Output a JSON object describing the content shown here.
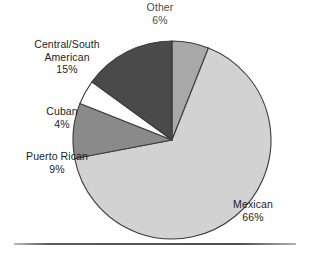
{
  "chart_data": {
    "type": "pie",
    "title": "",
    "subtitle": "",
    "xlabel": "",
    "ylabel": "",
    "legend_position": "none",
    "grid": false,
    "units": "percent",
    "start_angle_deg": 0,
    "direction": "clockwise",
    "categories": [
      "Other",
      "Mexican",
      "Puerto Rican",
      "Cuban",
      "Central/South American"
    ],
    "values": [
      6,
      66,
      9,
      4,
      15
    ],
    "slices": [
      {
        "label": "Other",
        "value": 6,
        "value_text": "6%",
        "color": "#a8a8a8",
        "start_pct": 0,
        "end_pct": 6,
        "label_lines": [
          "Other",
          "6%"
        ],
        "label_position": "top",
        "label_clipped": true
      },
      {
        "label": "Mexican",
        "value": 66,
        "value_text": "66%",
        "color": "#d2d2d2",
        "start_pct": 6,
        "end_pct": 72,
        "label_lines": [
          "Mexican",
          "66%"
        ],
        "label_position": "bottom-right",
        "label_clipped": false
      },
      {
        "label": "Puerto Rican",
        "value": 9,
        "value_text": "9%",
        "color": "#8a8a8a",
        "start_pct": 72,
        "end_pct": 81,
        "label_lines": [
          "Puerto Rican",
          "9%"
        ],
        "label_position": "left",
        "label_clipped": false
      },
      {
        "label": "Cuban",
        "value": 4,
        "value_text": "4%",
        "color": "#ffffff",
        "start_pct": 81,
        "end_pct": 85,
        "label_lines": [
          "Cuban",
          "4%"
        ],
        "label_position": "left",
        "label_clipped": false
      },
      {
        "label": "Central/South American",
        "value": 15,
        "value_text": "15%",
        "color": "#4a4a4a",
        "start_pct": 85,
        "end_pct": 100,
        "label_lines": [
          "Central/South",
          "American",
          "15%"
        ],
        "label_position": "upper-left",
        "label_clipped": false
      }
    ]
  },
  "labels": {
    "other": {
      "name": "Other",
      "pct": "6%"
    },
    "mexican": {
      "name": "Mexican",
      "pct": "66%"
    },
    "puerto_rican": {
      "name": "Puerto Rican",
      "pct": "9%"
    },
    "cuban": {
      "name": "Cuban",
      "pct": "4%"
    },
    "central_south": {
      "line1": "Central/South",
      "line2": "American",
      "pct": "15%"
    }
  },
  "colors": {
    "background": "#ffffff",
    "text": "#1c1c1c",
    "slice_outline": "#3d3d3d",
    "rule": "#4f4f4f",
    "other": "#a8a8a8",
    "mexican": "#d2d2d2",
    "puerto_rican": "#8a8a8a",
    "cuban": "#ffffff",
    "central_south": "#4a4a4a"
  },
  "geometry": {
    "center_x": 172,
    "center_y": 140,
    "radius": 99
  }
}
